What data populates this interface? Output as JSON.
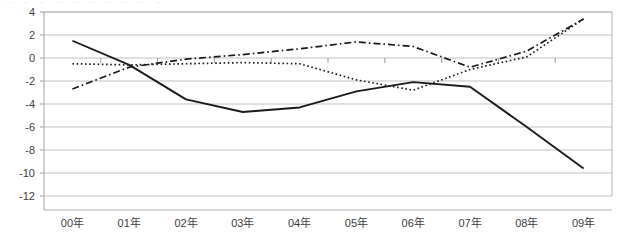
{
  "chart_data": {
    "type": "line",
    "title": "",
    "subtitle": "",
    "xlabel": "",
    "ylabel": "",
    "categories": [
      "00年",
      "01年",
      "02年",
      "03年",
      "04年",
      "05年",
      "06年",
      "07年",
      "08年",
      "09年"
    ],
    "ylim": [
      -12,
      4
    ],
    "ytick_values": [
      4,
      2,
      0,
      -2,
      -4,
      -6,
      -8,
      -10,
      -12
    ],
    "ytick_labels": [
      "4",
      "2",
      "0",
      "-2",
      "-4",
      "-6",
      "-8",
      "-10",
      "-12"
    ],
    "grid": true,
    "grid_axis": "y",
    "legend": "none",
    "series": [
      {
        "name": "series-solid",
        "style": "solid",
        "color": "#1a1a1a",
        "values": [
          1.5,
          -0.6,
          -3.6,
          -4.7,
          -4.3,
          -2.9,
          -2.1,
          -2.5,
          -6.0,
          -9.6
        ]
      },
      {
        "name": "series-dash-dot",
        "style": "dash-dot",
        "color": "#1a1a1a",
        "values": [
          -2.7,
          -0.8,
          -0.1,
          0.3,
          0.8,
          1.4,
          1.0,
          -0.8,
          0.6,
          3.4
        ]
      },
      {
        "name": "series-dotted",
        "style": "dotted",
        "color": "#1a1a1a",
        "values": [
          -0.5,
          -0.6,
          -0.5,
          -0.4,
          -0.5,
          -1.9,
          -2.8,
          -1.0,
          0.1,
          3.4
        ]
      }
    ]
  },
  "axis": {
    "plot_border_color": "#b3b3b3",
    "gridline_color": "#bfbfbf",
    "tick_color": "#999999",
    "label_color": "#404040"
  },
  "top_sliver": {
    "text": "‥ ‥ ‥ ‥  ‥ ‥   ‥ ‥ ‥  ‥"
  }
}
